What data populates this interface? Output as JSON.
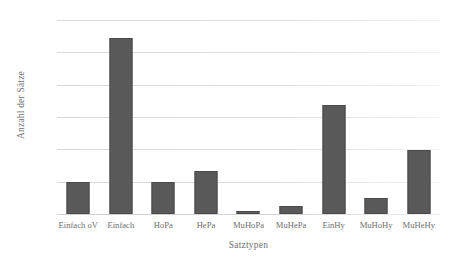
{
  "chart_data": {
    "type": "bar",
    "title": "",
    "xlabel": "Satztypen",
    "ylabel": "Anzahl der Sätze",
    "categories": [
      "Einfach oV",
      "Einfach",
      "HoPa",
      "HePa",
      "MuHoPa",
      "MuHePa",
      "EinHy",
      "MuHoHy",
      "MuHeHy"
    ],
    "values": [
      100,
      545,
      100,
      132,
      8,
      26,
      338,
      50,
      199
    ],
    "ylim": [
      0,
      600
    ],
    "yticks": [
      0,
      100,
      200,
      300,
      400,
      500,
      600
    ],
    "ytick_labels": [
      "0",
      "100",
      "200",
      "300",
      "400",
      "500",
      "600"
    ],
    "grid": true,
    "legend": false,
    "bar_color": "#595959",
    "gridline_color": "#dedede",
    "text_color": "#6f6f6f"
  }
}
